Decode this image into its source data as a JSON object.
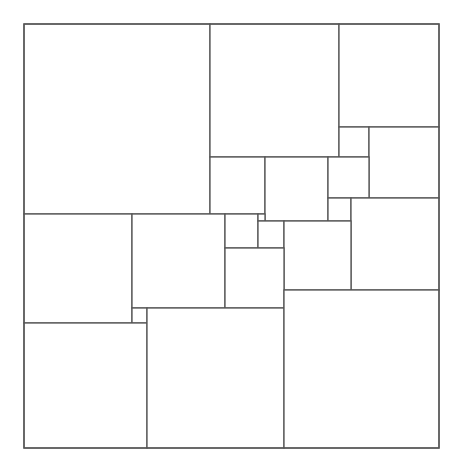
{
  "diagram": {
    "type": "squared-square dissection",
    "canvas": {
      "width": 464,
      "height": 471
    },
    "stroke_color": "#555555",
    "fill_color": "#ffffff",
    "outer": {
      "x": 24,
      "y": 24,
      "w": 415,
      "h": 424
    },
    "tiles": [
      {
        "id": "A",
        "x": 24,
        "y": 24,
        "w": 186,
        "h": 190
      },
      {
        "id": "B",
        "x": 210,
        "y": 24,
        "w": 129,
        "h": 133
      },
      {
        "id": "C",
        "x": 339,
        "y": 24,
        "w": 100,
        "h": 103
      },
      {
        "id": "D",
        "x": 339,
        "y": 127,
        "w": 30,
        "h": 30
      },
      {
        "id": "E",
        "x": 369,
        "y": 127,
        "w": 70,
        "h": 71
      },
      {
        "id": "G",
        "x": 210,
        "y": 157,
        "w": 55,
        "h": 57
      },
      {
        "id": "H",
        "x": 265,
        "y": 157,
        "w": 63,
        "h": 64
      },
      {
        "id": "F",
        "x": 328,
        "y": 157,
        "w": 41,
        "h": 41
      },
      {
        "id": "I",
        "x": 328,
        "y": 198,
        "w": 23,
        "h": 23
      },
      {
        "id": "O",
        "x": 351,
        "y": 198,
        "w": 88,
        "h": 92
      },
      {
        "id": "P",
        "x": 24,
        "y": 214,
        "w": 108,
        "h": 109
      },
      {
        "id": "Q",
        "x": 132,
        "y": 214,
        "w": 93,
        "h": 94
      },
      {
        "id": "J",
        "x": 225,
        "y": 214,
        "w": 33,
        "h": 34
      },
      {
        "id": "K",
        "x": 258,
        "y": 214,
        "w": 7,
        "h": 7
      },
      {
        "id": "L",
        "x": 258,
        "y": 221,
        "w": 26,
        "h": 27
      },
      {
        "id": "N",
        "x": 284,
        "y": 221,
        "w": 67,
        "h": 69
      },
      {
        "id": "M",
        "x": 225,
        "y": 248,
        "w": 59,
        "h": 60
      },
      {
        "id": "R",
        "x": 132,
        "y": 308,
        "w": 15,
        "h": 15
      },
      {
        "id": "S",
        "x": 24,
        "y": 323,
        "w": 123,
        "h": 125
      },
      {
        "id": "T",
        "x": 147,
        "y": 308,
        "w": 137,
        "h": 140
      },
      {
        "id": "U",
        "x": 284,
        "y": 290,
        "w": 155,
        "h": 158
      }
    ]
  }
}
